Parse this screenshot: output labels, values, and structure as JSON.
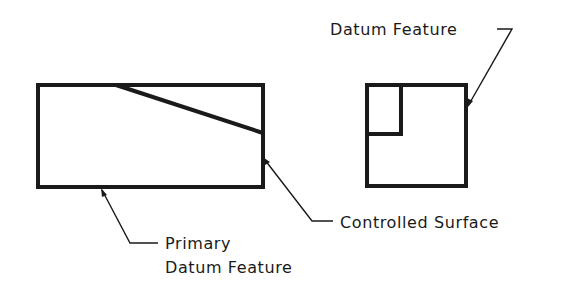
{
  "diagram": {
    "type": "engineering-drawing",
    "labels": {
      "datum_feature_top": "Datum Feature",
      "controlled_surface": "Controlled Surface",
      "primary_line1": "Primary",
      "primary_line2": "Datum Feature"
    },
    "colors": {
      "line": "#1a1a1a",
      "background": "#ffffff"
    },
    "shapes": {
      "front_view": {
        "x": 38,
        "y": 85,
        "width": 225,
        "height": 102,
        "diagonal": [
          116,
          85,
          263,
          134
        ]
      },
      "side_view": {
        "x": 367,
        "y": 85,
        "width": 99,
        "height": 101,
        "inner": {
          "x": 367,
          "y": 85,
          "width": 34,
          "height": 49
        }
      }
    }
  }
}
